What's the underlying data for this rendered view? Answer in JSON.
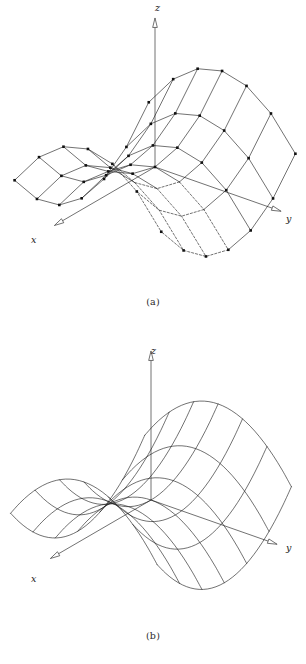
{
  "document": {
    "type": "figure-pair",
    "subject": "hyperbolic paraboloid saddle surface",
    "background_color": "#ffffff",
    "ink_color": "#1a1a1a"
  },
  "panels": [
    {
      "id": "a",
      "caption": "(a)",
      "style": "faceted polygonal mesh with plotted vertex markers and dashed hidden lines",
      "axes": {
        "z": {
          "label": "z",
          "label_x": 155,
          "label_y": 11
        },
        "y": {
          "label": "y",
          "label_x": 286,
          "label_y": 222
        },
        "x": {
          "label": "x",
          "label_x": 31,
          "label_y": 243
        }
      },
      "marker": {
        "shape": "square",
        "size": 2.6,
        "fill": "#111111"
      },
      "line_width": 0.62,
      "hidden_line_dash": "2.2,1.8"
    },
    {
      "id": "b",
      "caption": "(b)",
      "style": "smooth curved wireframe, no markers",
      "axes": {
        "z": {
          "label": "z",
          "label_x": 151,
          "label_y": 354
        },
        "y": {
          "label": "y",
          "label_x": 286,
          "label_y": 551
        },
        "x": {
          "label": "x",
          "label_x": 31,
          "label_y": 582
        }
      },
      "line_width": 0.62
    }
  ],
  "chart_data": {
    "type": "line",
    "title": "",
    "subtitle": "",
    "xlabel": "x",
    "ylabel": "y",
    "zlabel": "z",
    "surface": {
      "name": "saddle surface",
      "equation": "z = x^2 - y^2",
      "u_range": [
        -1,
        1
      ],
      "v_range": [
        -1,
        1
      ],
      "grid_divisions_u": 6,
      "grid_divisions_v": 6
    },
    "projection": {
      "kind": "axonometric",
      "x_axis_screen_unit": [
        -0.86,
        0.5
      ],
      "y_axis_screen_unit": [
        0.94,
        0.33
      ],
      "z_axis_screen_unit": [
        0.0,
        -1.0
      ],
      "panel_a_origin": [
        155,
        167
      ],
      "panel_a_scale_xy": 78,
      "panel_a_scale_z": 92,
      "panel_b_origin": [
        151,
        500
      ],
      "panel_b_scale_xy": 78,
      "panel_b_scale_z": 92
    },
    "axis_arrows": {
      "head_style": "hollow-triangle",
      "z_tip": [
        155,
        22
      ],
      "y_tip": [
        272,
        207
      ],
      "x_tip": [
        47,
        232
      ]
    },
    "legend": [],
    "annotations": [
      "(a)",
      "(b)"
    ],
    "grid": false
  },
  "footer": {
    "partial_text": ""
  }
}
